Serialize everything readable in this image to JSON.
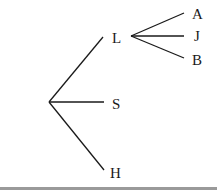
{
  "diagram": {
    "type": "tree",
    "root": {
      "label": "",
      "children": [
        {
          "label": "L",
          "children": [
            {
              "label": "A"
            },
            {
              "label": "J"
            },
            {
              "label": "B"
            }
          ]
        },
        {
          "label": "S"
        },
        {
          "label": "H"
        }
      ]
    }
  },
  "labels": {
    "l": "L",
    "s": "S",
    "h": "H",
    "a": "A",
    "j": "J",
    "b": "B"
  },
  "colors": {
    "line": "#1a1a1a",
    "bottom_border": "#9a9a9a"
  }
}
